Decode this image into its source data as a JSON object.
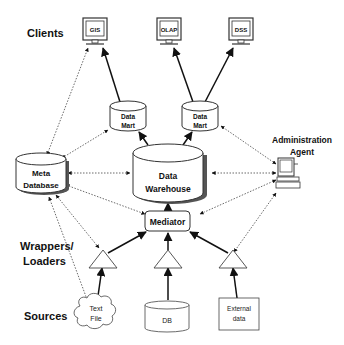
{
  "diagram": {
    "type": "data-warehouse-architecture",
    "row_labels": {
      "clients": "Clients",
      "wrappers_line1": "Wrappers/",
      "wrappers_line2": "Loaders",
      "sources": "Sources"
    },
    "clients": [
      {
        "id": "gis",
        "label": "GIS"
      },
      {
        "id": "olap",
        "label": "OLAP"
      },
      {
        "id": "dss",
        "label": "DSS"
      }
    ],
    "data_marts": [
      {
        "id": "mart1",
        "line1": "Data",
        "line2": "Mart"
      },
      {
        "id": "mart2",
        "line1": "Data",
        "line2": "Mart"
      }
    ],
    "meta_database": {
      "line1": "Meta",
      "line2": "Database"
    },
    "data_warehouse": {
      "line1": "Data",
      "line2": "Warehouse"
    },
    "admin_agent": {
      "line1": "Administration",
      "line2": "Agent"
    },
    "mediator": {
      "label": "Mediator"
    },
    "sources": [
      {
        "id": "textfile",
        "shape": "cloud",
        "line1": "Text",
        "line2": "File"
      },
      {
        "id": "db",
        "shape": "cylinder",
        "line1": "DB"
      },
      {
        "id": "external",
        "shape": "box",
        "line1": "External",
        "line2": "data"
      }
    ],
    "edges": [
      {
        "from": "mart1",
        "to": "gis",
        "style": "solid"
      },
      {
        "from": "mart2",
        "to": "olap",
        "style": "solid"
      },
      {
        "from": "mart2",
        "to": "dss",
        "style": "solid"
      },
      {
        "from": "warehouse",
        "to": "mart1",
        "style": "solid"
      },
      {
        "from": "warehouse",
        "to": "mart2",
        "style": "solid"
      },
      {
        "from": "mediator",
        "to": "warehouse",
        "style": "solid"
      },
      {
        "from": "wrapper1",
        "to": "mediator",
        "style": "solid"
      },
      {
        "from": "wrapper2",
        "to": "mediator",
        "style": "solid"
      },
      {
        "from": "wrapper3",
        "to": "mediator",
        "style": "solid"
      },
      {
        "from": "textfile",
        "to": "wrapper1",
        "style": "solid"
      },
      {
        "from": "db",
        "to": "wrapper2",
        "style": "solid"
      },
      {
        "from": "external",
        "to": "wrapper3",
        "style": "solid"
      },
      {
        "from": "metadb",
        "to": "gis",
        "style": "dotted-bidirectional"
      },
      {
        "from": "metadb",
        "to": "mart1",
        "style": "dotted-bidirectional"
      },
      {
        "from": "metadb",
        "to": "warehouse",
        "style": "dotted-bidirectional"
      },
      {
        "from": "metadb",
        "to": "mediator",
        "style": "dotted-bidirectional"
      },
      {
        "from": "metadb",
        "to": "wrapper1",
        "style": "dotted-bidirectional"
      },
      {
        "from": "metadb",
        "to": "textfile",
        "style": "dotted-bidirectional"
      },
      {
        "from": "admin",
        "to": "mart2",
        "style": "dotted-bidirectional"
      },
      {
        "from": "admin",
        "to": "warehouse",
        "style": "dotted-bidirectional"
      },
      {
        "from": "admin",
        "to": "mediator",
        "style": "dotted-bidirectional"
      },
      {
        "from": "admin",
        "to": "wrapper3",
        "style": "dotted-bidirectional"
      }
    ]
  }
}
